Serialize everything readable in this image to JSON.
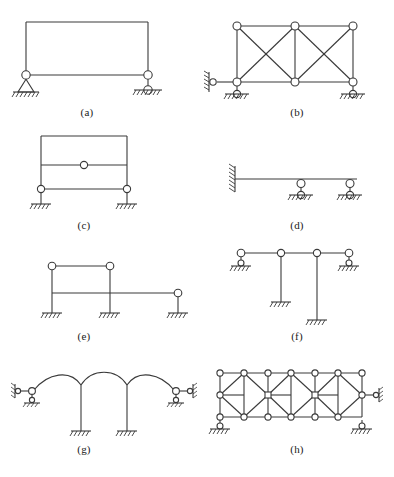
{
  "figure": {
    "background_color": "#ffffff",
    "line_color": "#3a3a3a",
    "node_fill_color": "#ffffff",
    "caption_color": "#1a1a1a",
    "panel_count": 8
  },
  "panels": [
    {
      "id": "a",
      "caption": "(a)",
      "description": "Portal frame with pin support at left base and roller support at right base, hinges at both column tops",
      "supports": [
        "pin",
        "roller"
      ],
      "hinge_count": 2,
      "member_count": 3
    },
    {
      "id": "b",
      "caption": "(b)",
      "description": "Two-bay cross-braced truss, link plus roller at left base, roller at right base",
      "supports": [
        "link-roller",
        "roller"
      ],
      "hinge_count": 6,
      "member_count": 13
    },
    {
      "id": "c",
      "caption": "(c)",
      "description": "Two-story fixed-base frame with mid-span hinge in upper beam and end hinges in lower beam",
      "supports": [
        "fixed",
        "fixed"
      ],
      "hinge_count": 3,
      "member_count": 4
    },
    {
      "id": "d",
      "caption": "(d)",
      "description": "Cantilever beam fixed to wall at left with two roller supports beneath the span",
      "supports": [
        "fixed-wall",
        "roller",
        "roller"
      ],
      "hinge_count": 2,
      "member_count": 1
    },
    {
      "id": "e",
      "caption": "(e)",
      "description": "Stepped frame with three fixed column bases, hinges at top of left and middle columns and at right beam end",
      "supports": [
        "fixed",
        "fixed",
        "fixed"
      ],
      "hinge_count": 3,
      "member_count": 6
    },
    {
      "id": "f",
      "caption": "(f)",
      "description": "Continuous beam with inclined roller supports at each end and two suspended fixed-base columns",
      "supports": [
        "inclined-roller",
        "fixed",
        "fixed",
        "inclined-roller"
      ],
      "hinge_count": 4,
      "member_count": 5
    },
    {
      "id": "g",
      "caption": "(g)",
      "description": "Three-arch structure on two fixed columns with link and roller supports at both outer ends",
      "supports": [
        "link-roller",
        "fixed",
        "fixed",
        "link-roller"
      ],
      "hinge_count": 2,
      "arch_count": 3
    },
    {
      "id": "h",
      "caption": "(h)",
      "description": "Three-panel diamond-braced truss, roller support at left base and link-roller support at right base",
      "supports": [
        "roller",
        "link-roller"
      ],
      "node_count": 18,
      "member_count": 37
    }
  ]
}
